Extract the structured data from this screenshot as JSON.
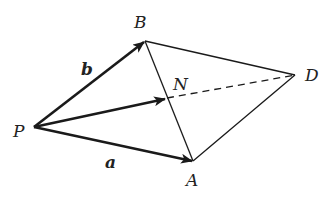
{
  "diagram": {
    "title": "",
    "points": {
      "P": {
        "label": "P",
        "x": 34,
        "y": 127
      },
      "B": {
        "label": "B",
        "x": 145,
        "y": 41
      },
      "A": {
        "label": "A",
        "x": 193,
        "y": 161
      },
      "D": {
        "label": "D",
        "x": 295,
        "y": 75
      },
      "N": {
        "label": "N",
        "x": 165,
        "y": 99
      }
    },
    "vectors": {
      "b": {
        "label": "b",
        "from": "P",
        "to": "B"
      },
      "a": {
        "label": "a",
        "from": "P",
        "to": "A"
      },
      "PN": {
        "label": "",
        "from": "P",
        "to": "N"
      }
    },
    "segments": [
      {
        "from": "B",
        "to": "D",
        "style": "solid"
      },
      {
        "from": "A",
        "to": "D",
        "style": "solid"
      },
      {
        "from": "B",
        "to": "A",
        "style": "solid"
      },
      {
        "from": "N",
        "to": "D",
        "style": "dashed"
      }
    ],
    "colors": {
      "stroke": "#1a1a1a",
      "background": "#ffffff"
    }
  }
}
